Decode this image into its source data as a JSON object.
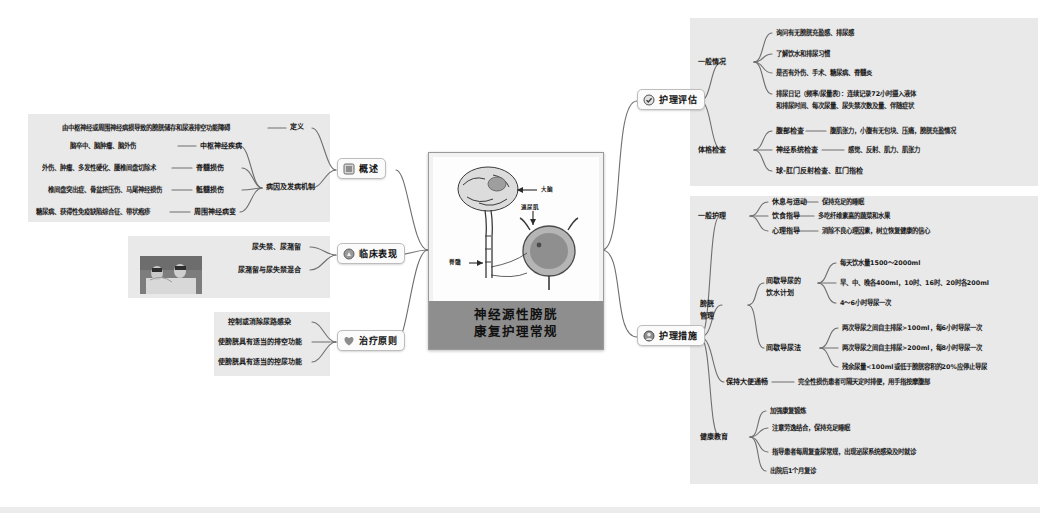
{
  "center": {
    "title_line1": "神经源性膀胱",
    "title_line2": "康复护理常规",
    "illustration_labels": {
      "brain": "大脑",
      "detrusor": "逼尿肌",
      "spinal_cord": "脊髓"
    }
  },
  "branches": [
    {
      "id": "overview",
      "label": "概述",
      "icon": "book-icon",
      "side": "left"
    },
    {
      "id": "clinical",
      "label": "临床表现",
      "icon": "microscope-icon",
      "side": "left"
    },
    {
      "id": "treatment",
      "label": "治疗原则",
      "icon": "heart-icon",
      "side": "left"
    },
    {
      "id": "assessment",
      "label": "护理评估",
      "icon": "check-circle-icon",
      "side": "right"
    },
    {
      "id": "measures",
      "label": "护理措施",
      "icon": "nurse-icon",
      "side": "right"
    }
  ],
  "overview": {
    "definition": {
      "label": "定义",
      "text": "由中枢神经或周围神经病损导致的膀胱储存和尿液排空功能障碍"
    },
    "etiology": {
      "label": "病因及发病机制",
      "items": [
        {
          "category": "中枢神经疾病",
          "detail": "脑卒中、脑肿瘤、脑外伤"
        },
        {
          "category": "脊髓损伤",
          "detail": "外伤、肿瘤、多发性硬化、腰椎间盘切除术"
        },
        {
          "category": "骶髓损伤",
          "detail": "椎间盘突出症、骨盆挤压伤、马尾神经损伤"
        },
        {
          "category": "周围神经病变",
          "detail": "糖尿病、获得性免疫缺陷综合征、带状疱疹"
        }
      ]
    }
  },
  "clinical": {
    "items": [
      "尿失禁、尿潴留",
      "尿潴留与尿失禁混合"
    ],
    "has_photo": true
  },
  "treatment": {
    "items": [
      "控制或消除尿路感染",
      "使膀胱具有适当的排空功能",
      "使膀胱具有适当的控尿功能"
    ]
  },
  "assessment": {
    "groups": [
      {
        "label": "一般情况",
        "items": [
          {
            "text": "询问有无膀胱充盈感、排尿感"
          },
          {
            "text": "了解饮水和排尿习惯"
          },
          {
            "text": "是否有外伤、手术、糖尿病、脊髓炎"
          },
          {
            "text": "排尿日记（频率/尿量表）：连续记录72小时摄入液体"
          },
          {
            "text": "和排尿时间、每次尿量、尿失禁次数及量、伴随症状",
            "continuation": true
          }
        ]
      },
      {
        "label": "体格检查",
        "items": [
          {
            "text": "腹部检查",
            "detail": "腹肌张力，小腹有无包块、压痛，膀胱充盈情况"
          },
          {
            "text": "神经系统检查",
            "detail": "感觉、反射、肌力、肌张力"
          },
          {
            "text": "球-肛门反射检查、肛门指检"
          }
        ]
      }
    ]
  },
  "measures": {
    "groups": [
      {
        "label": "一般护理",
        "items": [
          {
            "text": "休息与运动",
            "detail": "保持充足的睡眠"
          },
          {
            "text": "饮食指导",
            "detail": "多吃纤维素高的蔬菜和水果"
          },
          {
            "text": "心理指导",
            "detail": "消除不良心理因素，树立恢复健康的信心"
          }
        ]
      },
      {
        "label": "膀胱管理",
        "label_line1": "膀胱",
        "label_line2": "管理",
        "subgroups": [
          {
            "label_line1": "间歇导尿的",
            "label_line2": "饮水计划",
            "items": [
              "每天饮水量1500～2000ml",
              "早、中、晚各400ml，10时、16时、20时各200ml",
              "4～6小时导尿一次"
            ]
          },
          {
            "label": "间歇导尿法",
            "items": [
              "两次导尿之间自主排尿>100ml，每6小时导尿一次",
              "两次导尿之间自主排尿>200ml，每8小时导尿一次",
              "残余尿量<100ml或低于膀胱容积的20%应停止导尿"
            ]
          }
        ]
      },
      {
        "label": "保持大便通畅",
        "detail": "完全性损伤患者可隔天定时排便，用手指按摩腹部"
      },
      {
        "label": "健康教育",
        "items": [
          "加强康复锻炼",
          "注意劳逸结合，保持充足睡眠",
          "指导患者每周复查尿常规，出现泌尿系统感染及时就诊",
          "出院后1个月复诊"
        ]
      }
    ]
  },
  "colors": {
    "panel_bg": "#e9e9e9",
    "page_bg": "#ffffff",
    "branch_bg": "#fbfbfb",
    "branch_border": "#bdbdbd",
    "connector": "#6f6f6f",
    "title_bar": "#8e8e8e",
    "text": "#1a1a1a"
  }
}
